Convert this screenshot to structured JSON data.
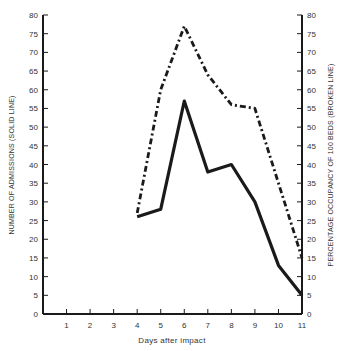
{
  "chart_data": {
    "type": "line",
    "title": "",
    "xlabel": "Days after impact",
    "ylabel": "NUMBER OF ADMISSIONS (SOLID LINE)",
    "ylabel_right": "PERCENTAGE OCCUPANCY OF 100 BEDS (BROKEN LINE)",
    "x_ticks": [
      1,
      2,
      3,
      4,
      5,
      6,
      7,
      8,
      9,
      10,
      11
    ],
    "x_range": [
      0,
      11
    ],
    "y_ticks": [
      0,
      5,
      10,
      15,
      20,
      25,
      30,
      35,
      40,
      45,
      50,
      55,
      60,
      65,
      70,
      75,
      80
    ],
    "ylim": [
      0,
      80
    ],
    "ylim_right": [
      0,
      80
    ],
    "grid": false,
    "legend": "none (line styles described in axis titles)",
    "x": [
      4,
      5,
      6,
      7,
      8,
      9,
      10,
      11
    ],
    "series": [
      {
        "name": "Number of admissions",
        "style": "solid",
        "axis": "left",
        "values": [
          26,
          28,
          57,
          38,
          40,
          30,
          13,
          5
        ]
      },
      {
        "name": "Percentage occupancy of 100 beds",
        "style": "dash-dot",
        "axis": "right",
        "values": [
          27,
          60,
          77,
          64,
          56,
          55,
          35,
          15
        ]
      }
    ]
  },
  "colors": {
    "line": "#1a1a1a",
    "axis": "#1a1a1a",
    "text": "#333333"
  }
}
